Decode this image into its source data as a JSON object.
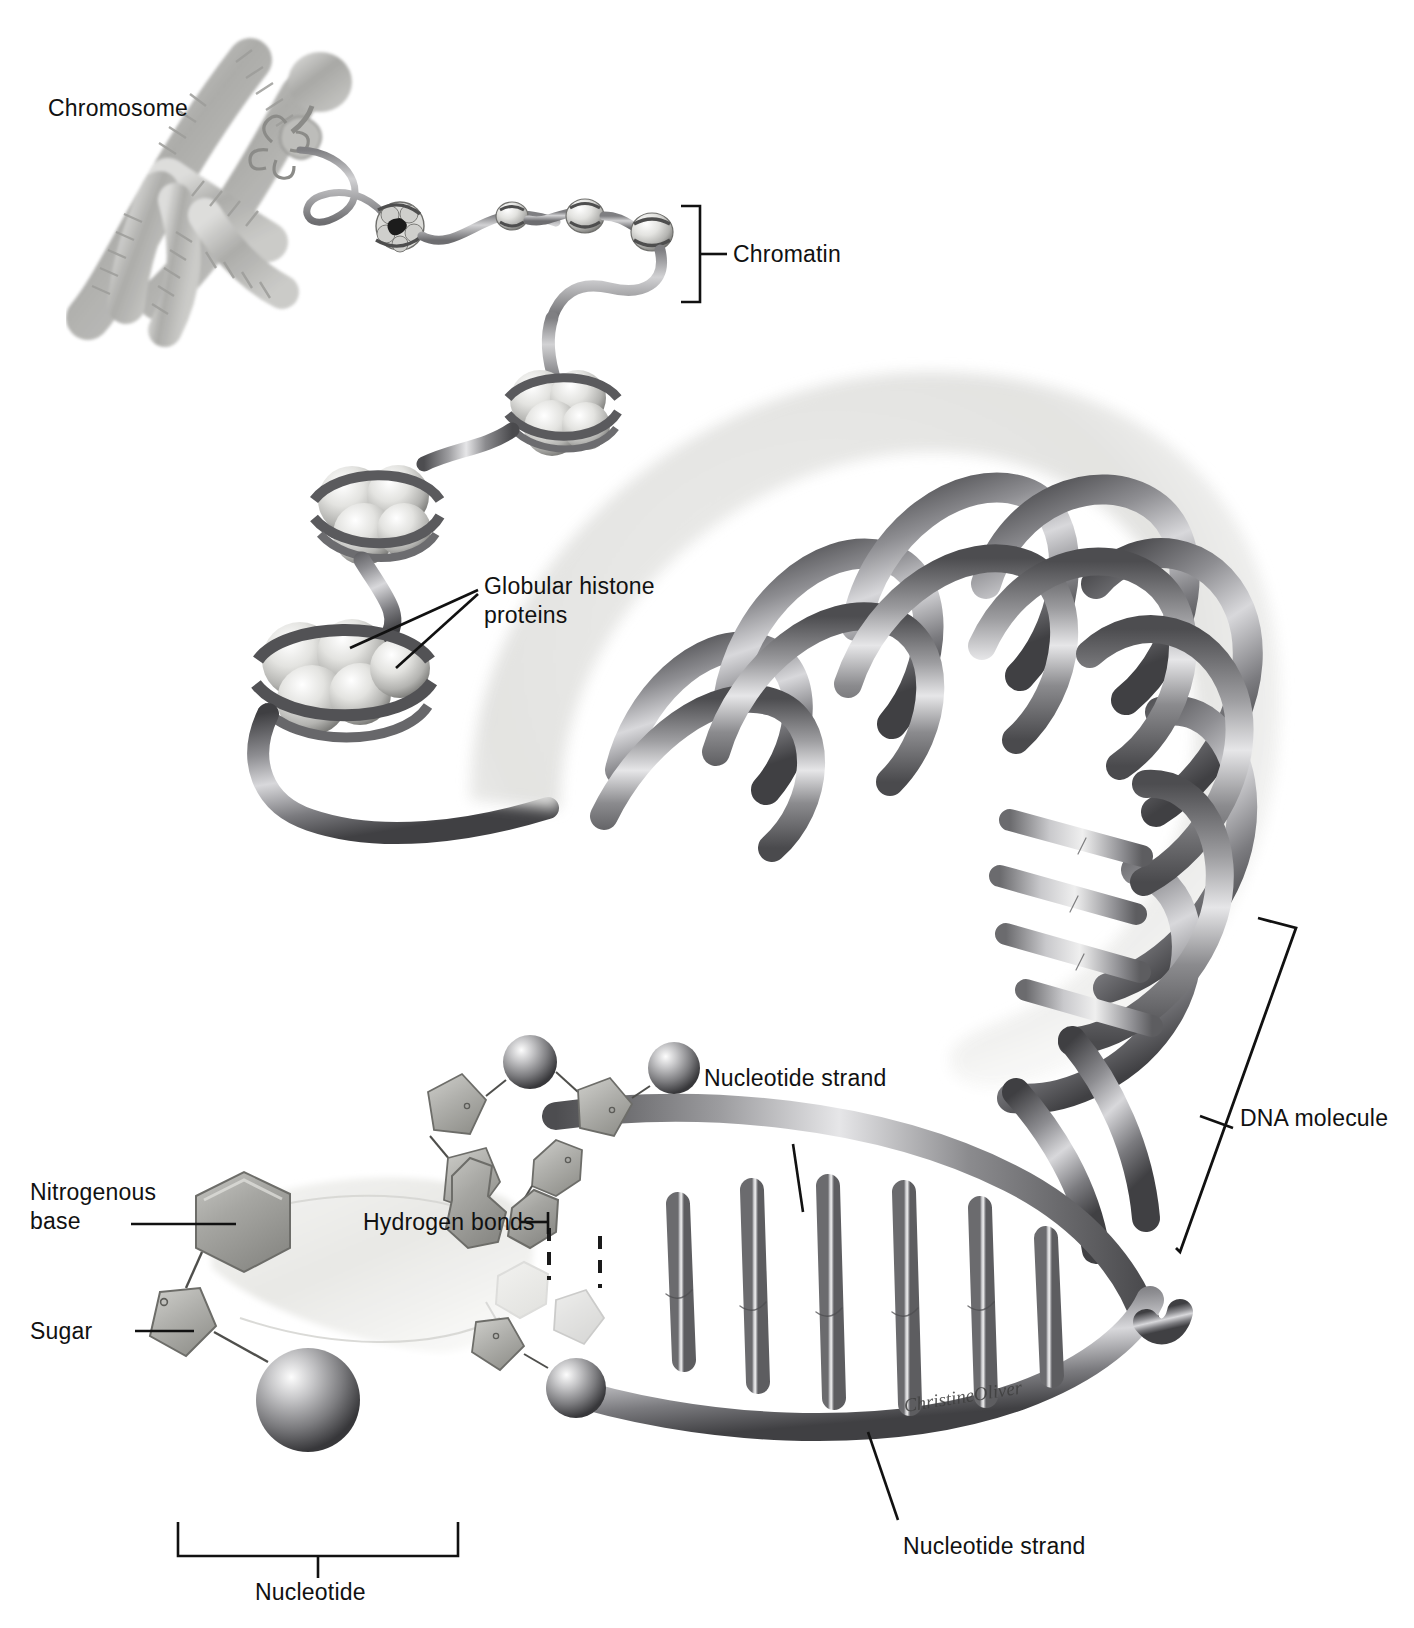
{
  "figure": {
    "background_color": "#ffffff",
    "ink_color": "#111111",
    "artist_signature": "ChristineOliver"
  },
  "labels": {
    "chromosome": "Chromosome",
    "chromatin": "Chromatin",
    "globular_histone_proteins_line1": "Globular histone",
    "globular_histone_proteins_line2": "proteins",
    "dna_molecule": "DNA molecule",
    "nucleotide_strand_upper": "Nucleotide strand",
    "nucleotide_strand_lower": "Nucleotide strand",
    "hydrogen_bonds": "Hydrogen bonds",
    "nitrogenous_base_line1": "Nitrogenous",
    "nitrogenous_base_line2": "base",
    "sugar": "Sugar",
    "nucleotide": "Nucleotide"
  },
  "brackets": [
    {
      "name": "chromatin-bracket",
      "label": "Chromatin",
      "orientation": "vertical-right"
    },
    {
      "name": "dna-molecule-bracket",
      "label": "DNA molecule",
      "orientation": "vertical-slanted"
    },
    {
      "name": "nucleotide-bracket",
      "label": "Nucleotide",
      "orientation": "horizontal-bottom"
    }
  ],
  "structures": [
    {
      "name": "chromosome",
      "description": "duplicated X-shaped condensed chromosome"
    },
    {
      "name": "chromatin-fiber",
      "description": "beads-on-a-string nucleosome chain"
    },
    {
      "name": "nucleosome",
      "description": "globular histone octamer wrapped by DNA",
      "count": 4
    },
    {
      "name": "dna-supercoil",
      "description": "large curved DNA double helix coil"
    },
    {
      "name": "dna-ladder",
      "description": "unwound double helix showing base pair rungs"
    },
    {
      "name": "phosphate-group",
      "description": "sphere"
    },
    {
      "name": "sugar-group",
      "description": "pentagon"
    },
    {
      "name": "nitrogenous-base",
      "description": "hexagon / purine double ring"
    },
    {
      "name": "hydrogen-bond",
      "description": "dashed vertical line"
    }
  ],
  "palette": {
    "helix_dark": "#58585a",
    "helix_mid": "#8d8d90",
    "helix_light": "#d7d7d9",
    "histone_light": "#e2e2e0",
    "histone_shadow": "#9a9a98",
    "backdrop_gray": "#e4e4e2",
    "chromosome_gray": "#a6a6a4",
    "base_gray": "#a9a9a6",
    "sugar_gray": "#b5b5b1",
    "phosphate_dark": "#6e6e6c"
  }
}
